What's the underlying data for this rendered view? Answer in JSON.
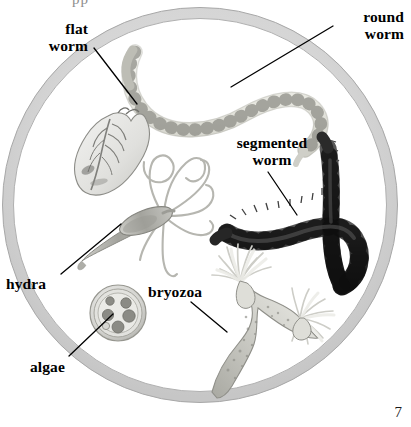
{
  "figure": {
    "kind": "scientific-illustration",
    "page_number": "7",
    "cropped_text_top": "pp",
    "colors": {
      "background": "#ffffff",
      "ring_fill": "#d7d7d7",
      "ring_edge": "#9a9a9a",
      "label_text": "#000000",
      "leader_line": "#000000",
      "roundworm_body": "#e8e8e2",
      "roundworm_outline": "#8e8e88",
      "flatworm_body": "#e4e4e2",
      "flatworm_detail": "#7d7d79",
      "segmented_worm_body": "#3b3b3b",
      "segmented_worm_dark": "#1d1d1d",
      "hydra_body": "#a9a9a4",
      "hydra_tentacle": "#b4b4ae",
      "algae_wall": "#c9c9c6",
      "algae_granule": "#8a8a86",
      "bryozoa_stalk": "#b8b8b2",
      "bryozoa_crown": "#efefec"
    }
  },
  "viewing_field": {
    "name": "circular viewing field",
    "center_x": 200,
    "center_y": 205,
    "outer_radius": 196,
    "ring_thickness": 11
  },
  "labels": [
    {
      "id": "flat-worm",
      "text": "flat\nworm",
      "align": "right",
      "leader": {
        "from_x": 94,
        "from_y": 48,
        "to_x": 137,
        "to_y": 104
      }
    },
    {
      "id": "round-worm",
      "text": "round\nworm",
      "align": "right",
      "leader": {
        "from_x": 333,
        "from_y": 26,
        "to_x": 231,
        "to_y": 87
      }
    },
    {
      "id": "segmented-worm",
      "text": "segmented\nworm",
      "align": "center",
      "leader": {
        "from_x": 268,
        "from_y": 172,
        "to_x": 297,
        "to_y": 215
      }
    },
    {
      "id": "hydra",
      "text": "hydra",
      "align": "left",
      "leader": {
        "from_x": 61,
        "from_y": 274,
        "to_x": 121,
        "to_y": 224
      }
    },
    {
      "id": "bryozoa",
      "text": "bryozoa",
      "align": "left",
      "leader": {
        "from_x": 191,
        "from_y": 302,
        "to_x": 227,
        "to_y": 332
      }
    },
    {
      "id": "algae",
      "text": "algae",
      "align": "left",
      "leader": {
        "from_x": 69,
        "from_y": 356,
        "to_x": 113,
        "to_y": 314
      }
    }
  ],
  "organisms": [
    {
      "id": "round-worm",
      "common_name": "round worm",
      "description": "pale S-curved segmented nematode, tapered at both ends"
    },
    {
      "id": "flat-worm",
      "common_name": "flat worm",
      "description": "leaf-shaped flattened body with branched gut markings"
    },
    {
      "id": "segmented-worm",
      "common_name": "segmented worm",
      "description": "dark hooked annelid with bristles along each segment"
    },
    {
      "id": "hydra",
      "common_name": "hydra",
      "description": "tapered column body with long curling tentacles"
    },
    {
      "id": "algae",
      "common_name": "algae",
      "description": "round cell with thick wall and six internal granules"
    },
    {
      "id": "bryozoa",
      "common_name": "bryozoa",
      "description": "branching stalk with two crown-like tentacle tufts"
    }
  ]
}
